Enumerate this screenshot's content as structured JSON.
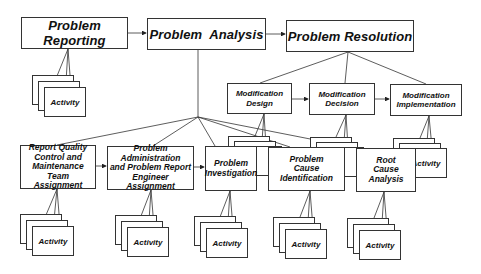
{
  "diagram": {
    "top_row": [
      {
        "id": "problem-reporting",
        "label": "Problem Reporting"
      },
      {
        "id": "problem-analysis",
        "label": "Problem  Analysis"
      },
      {
        "id": "problem-resolution",
        "label": "Problem Resolution"
      }
    ],
    "modification_row": [
      {
        "id": "modification-design",
        "label": "Modification Design",
        "lines": [
          "Modification",
          "Design"
        ]
      },
      {
        "id": "modification-decision",
        "label": "Modification Decision",
        "lines": [
          "Modification",
          "Decision"
        ]
      },
      {
        "id": "modification-implementation",
        "label": "Modification Implementation",
        "lines": [
          "Modification",
          "Implementation"
        ]
      }
    ],
    "analysis_row": [
      {
        "id": "report-quality-control",
        "lines": [
          "Report Quality",
          "Control and",
          "Maintenance Team",
          "Assignment"
        ]
      },
      {
        "id": "problem-administration",
        "lines": [
          "Problem",
          "Administration",
          "and Problem Report",
          "Engineer Assignment"
        ]
      },
      {
        "id": "problem-investigation",
        "lines": [
          "Problem",
          "Investigation"
        ]
      },
      {
        "id": "problem-cause-identification",
        "lines": [
          "Problem",
          "Cause",
          "Identification"
        ]
      },
      {
        "id": "root-cause-analysis",
        "lines": [
          "Root",
          "Cause",
          "Analysis"
        ]
      }
    ],
    "activity_label": "Activity",
    "activities": [
      {
        "parent": "problem-reporting",
        "label": "Activity"
      },
      {
        "parent": "report-quality-control",
        "label": "Activity"
      },
      {
        "parent": "problem-administration",
        "label": "Activity"
      },
      {
        "parent": "problem-investigation",
        "label": "Activity"
      },
      {
        "parent": "problem-cause-identification",
        "label": "Activity"
      },
      {
        "parent": "root-cause-analysis",
        "label": "Activity"
      },
      {
        "parent": "modification-design",
        "label": "Activity"
      },
      {
        "parent": "modification-decision",
        "label": "Activity"
      },
      {
        "parent": "modification-implementation",
        "label": "Activity"
      }
    ],
    "colors": {
      "line": "#333333",
      "text": "#111111",
      "background": "#ffffff"
    }
  }
}
